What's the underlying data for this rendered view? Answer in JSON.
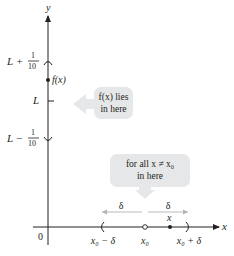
{
  "diagram": {
    "type": "epsilon-delta limit illustration",
    "colors": {
      "axis": "#231f20",
      "bubble_fill": "#e6e7e8",
      "arrow_gray": "#b3b3b3",
      "point": "#231f20"
    },
    "axes": {
      "y_label": "y",
      "x_label": "x",
      "origin_label": "0"
    },
    "y_axis_labels": {
      "upper": {
        "base": "L +",
        "num": "1",
        "den": "10"
      },
      "middle": "L",
      "lower": {
        "base": "L −",
        "num": "1",
        "den": "10"
      },
      "fx": "f(x)"
    },
    "x_axis_labels": {
      "left": "x₀ − δ",
      "center": "x₀",
      "right": "x₀ + δ",
      "point": "x"
    },
    "delta_labels": {
      "left": "δ",
      "right": "δ"
    },
    "bubbles": {
      "fx_bubble": {
        "line1": "f(x) lies",
        "line2": "in here"
      },
      "x_bubble": {
        "line1": "for all x ≠ x₀",
        "line2": "in here"
      }
    }
  }
}
